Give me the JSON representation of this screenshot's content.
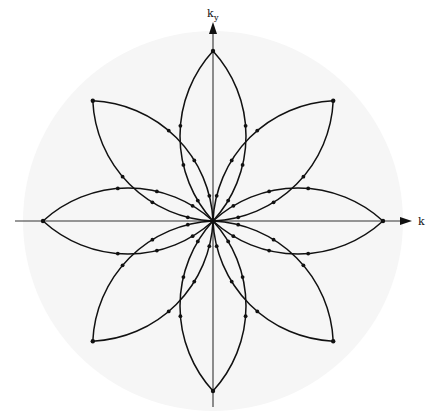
{
  "figure": {
    "axes": {
      "horizontal_label": "k",
      "horizontal_subscript": "",
      "vertical_label": "k",
      "vertical_subscript": "y"
    },
    "petals": {
      "count": 8,
      "angles_deg": [
        0,
        45,
        90,
        135,
        180,
        225,
        270,
        315
      ],
      "dot_fractions_per_edge": [
        0.12,
        0.33,
        0.56
      ]
    },
    "colors": {
      "line": "#111111",
      "axis": "#333333",
      "background": "#ffffff",
      "background_disk": "#f6f6f6"
    }
  }
}
